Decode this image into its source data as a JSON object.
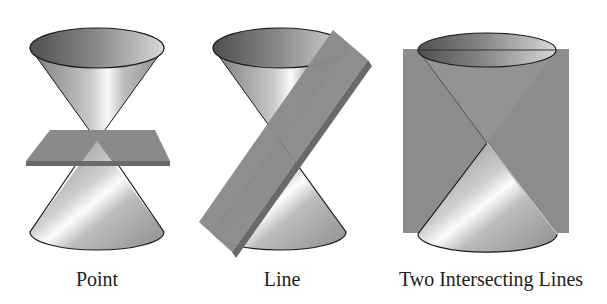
{
  "figure": {
    "panels": [
      {
        "id": "point",
        "caption": "Point",
        "center_x": 97
      },
      {
        "id": "line",
        "caption": "Line",
        "center_x": 282
      },
      {
        "id": "two-lines",
        "caption": "Two Intersecting Lines",
        "center_x": 491
      }
    ]
  },
  "colors": {
    "plane": "#8a8a8a",
    "plane_edge": "#6a6a6a",
    "cone_dark": "#6e6e6e",
    "cone_light": "#f4f4f4",
    "outline": "#1a1a1a"
  }
}
